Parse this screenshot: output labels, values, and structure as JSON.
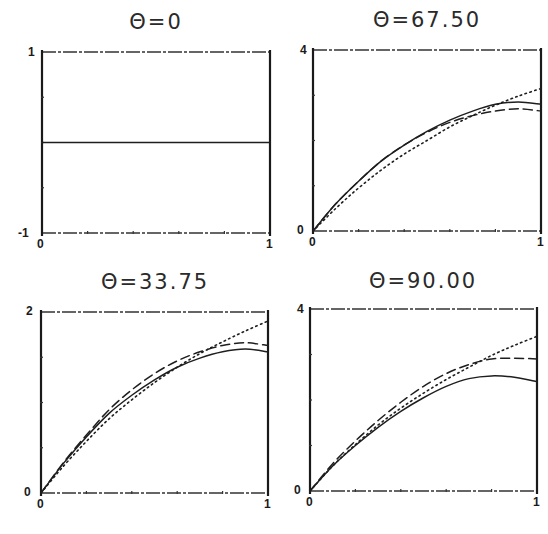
{
  "chart_data": [
    {
      "type": "line",
      "title": "Θ=0",
      "xlabel": "",
      "ylabel": "",
      "xlim": [
        0,
        1
      ],
      "ylim": [
        -1,
        1
      ],
      "x_ticks": [
        "0",
        "1"
      ],
      "y_ticks": [
        "-1",
        "1"
      ],
      "grid": false,
      "legend": null,
      "x": [
        0,
        0.25,
        0.5,
        0.75,
        1.0
      ],
      "series": [
        {
          "name": "solid",
          "style": "solid",
          "values": [
            0,
            0,
            0,
            0,
            0
          ]
        }
      ]
    },
    {
      "type": "line",
      "title": "Θ=67.50",
      "xlabel": "",
      "ylabel": "",
      "xlim": [
        0,
        1
      ],
      "ylim": [
        0,
        4
      ],
      "x_ticks": [
        "0",
        "1"
      ],
      "y_ticks": [
        "0",
        "4"
      ],
      "grid": false,
      "legend": null,
      "x": [
        0,
        0.1,
        0.2,
        0.3,
        0.4,
        0.5,
        0.6,
        0.7,
        0.8,
        0.9,
        1.0
      ],
      "series": [
        {
          "name": "solid",
          "style": "solid",
          "values": [
            0,
            0.6,
            1.1,
            1.55,
            1.9,
            2.2,
            2.45,
            2.65,
            2.8,
            2.85,
            2.8
          ]
        },
        {
          "name": "dashed",
          "style": "dashed",
          "values": [
            0,
            0.6,
            1.1,
            1.55,
            1.9,
            2.18,
            2.4,
            2.55,
            2.65,
            2.7,
            2.65
          ]
        },
        {
          "name": "dotted",
          "style": "dotted",
          "values": [
            0,
            0.5,
            0.95,
            1.35,
            1.7,
            2.0,
            2.3,
            2.55,
            2.78,
            2.98,
            3.15
          ]
        }
      ]
    },
    {
      "type": "line",
      "title": "Θ=33.75",
      "xlabel": "",
      "ylabel": "",
      "xlim": [
        0,
        1
      ],
      "ylim": [
        0,
        2
      ],
      "x_ticks": [
        "0",
        "1"
      ],
      "y_ticks": [
        "0",
        "2"
      ],
      "grid": false,
      "legend": null,
      "x": [
        0,
        0.1,
        0.2,
        0.3,
        0.4,
        0.5,
        0.6,
        0.7,
        0.8,
        0.9,
        1.0
      ],
      "series": [
        {
          "name": "solid",
          "style": "solid",
          "values": [
            0,
            0.33,
            0.62,
            0.88,
            1.08,
            1.25,
            1.39,
            1.49,
            1.56,
            1.59,
            1.56
          ]
        },
        {
          "name": "dashed",
          "style": "dashed",
          "values": [
            0,
            0.34,
            0.64,
            0.92,
            1.14,
            1.32,
            1.46,
            1.56,
            1.63,
            1.66,
            1.63
          ]
        },
        {
          "name": "dotted",
          "style": "dotted",
          "values": [
            0,
            0.3,
            0.57,
            0.82,
            1.03,
            1.22,
            1.39,
            1.54,
            1.67,
            1.79,
            1.9
          ]
        }
      ]
    },
    {
      "type": "line",
      "title": "Θ=90.00",
      "xlabel": "",
      "ylabel": "",
      "xlim": [
        0,
        1
      ],
      "ylim": [
        0,
        4
      ],
      "x_ticks": [
        "0",
        "1"
      ],
      "y_ticks": [
        "0",
        "4"
      ],
      "grid": false,
      "legend": null,
      "x": [
        0,
        0.1,
        0.2,
        0.3,
        0.4,
        0.5,
        0.6,
        0.7,
        0.8,
        0.9,
        1.0
      ],
      "series": [
        {
          "name": "solid",
          "style": "solid",
          "values": [
            0,
            0.55,
            1.0,
            1.4,
            1.75,
            2.05,
            2.3,
            2.47,
            2.53,
            2.5,
            2.4
          ]
        },
        {
          "name": "dashed",
          "style": "dashed",
          "values": [
            0,
            0.6,
            1.1,
            1.55,
            1.95,
            2.3,
            2.58,
            2.78,
            2.9,
            2.92,
            2.9
          ]
        },
        {
          "name": "dotted",
          "style": "dotted",
          "values": [
            0,
            0.55,
            1.02,
            1.45,
            1.82,
            2.15,
            2.45,
            2.72,
            2.98,
            3.2,
            3.4
          ]
        }
      ]
    }
  ],
  "panels": [
    {
      "title": "Θ=0",
      "y_top": "1",
      "y_bottom": "-1",
      "x_left": "0",
      "x_right": "1"
    },
    {
      "title": "Θ=67.50",
      "y_top": "4",
      "y_bottom": "0",
      "x_left": "0",
      "x_right": "1"
    },
    {
      "title": "Θ=33.75",
      "y_top": "2",
      "y_bottom": "0",
      "x_left": "0",
      "x_right": "1"
    },
    {
      "title": "Θ=90.00",
      "y_top": "4",
      "y_bottom": "0",
      "x_left": "0",
      "x_right": "1"
    }
  ]
}
